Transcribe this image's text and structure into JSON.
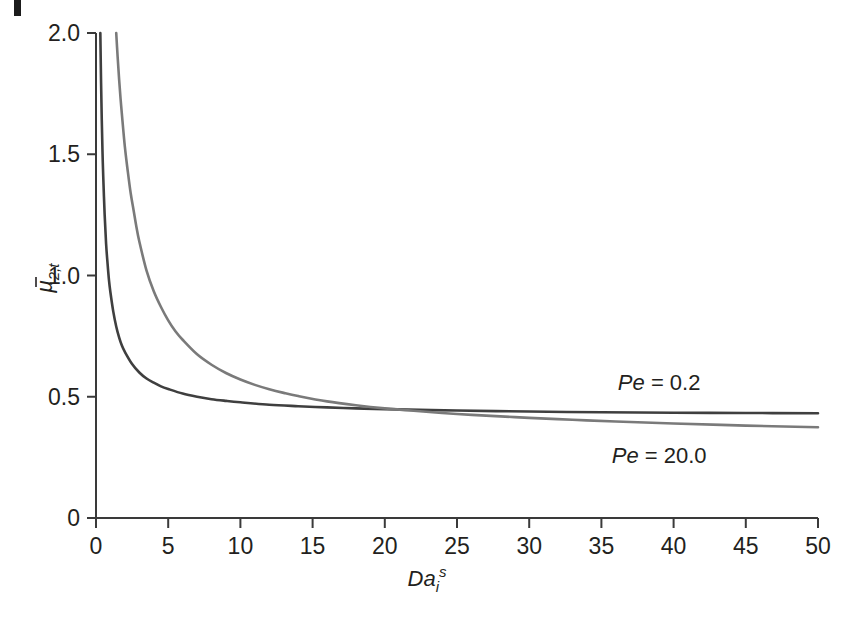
{
  "figure": {
    "background_color": "#ffffff",
    "axis_color": "#3a3a3a",
    "text_color": "#231f20",
    "edge_artifact": true
  },
  "chart_data": {
    "type": "line",
    "title": "",
    "subtitle": "",
    "xlabel_parts": {
      "base": "Da",
      "sub": "i",
      "sup": "s"
    },
    "xlabel": "Da_i^s",
    "ylabel_parts": {
      "base": "μ",
      "overbar": true,
      "sub": "2,t"
    },
    "ylabel": "μ̄2,t",
    "xlim": [
      0,
      50
    ],
    "ylim": [
      0,
      2.0
    ],
    "xticks": [
      0,
      5,
      10,
      15,
      20,
      25,
      30,
      35,
      40,
      45,
      50
    ],
    "xtick_labels": [
      "0",
      "5",
      "10",
      "15",
      "20",
      "25",
      "30",
      "35",
      "40",
      "45",
      "50"
    ],
    "yticks": [
      0,
      0.5,
      1.0,
      1.5,
      2.0
    ],
    "ytick_labels": [
      "0",
      "0.5",
      "1.0",
      "1.5",
      "2.0"
    ],
    "grid": false,
    "legend_position": "inline-annotations",
    "series": [
      {
        "name": "Pe = 0.2",
        "color": "#3f3f3f",
        "width": 2.6,
        "annotation": {
          "text_parts": {
            "italic": "Pe",
            "rest": " = 0.2"
          },
          "text": "Pe = 0.2",
          "x": 39.0,
          "y": 0.56
        },
        "x": [
          0.3,
          0.35,
          0.4,
          0.45,
          0.5,
          0.6,
          0.7,
          0.8,
          0.9,
          1.0,
          1.2,
          1.4,
          1.6,
          1.8,
          2.0,
          2.5,
          3.0,
          3.5,
          4.0,
          4.5,
          5.0,
          6.0,
          7.0,
          8.0,
          9.0,
          10.0,
          12.0,
          14.0,
          16.0,
          18.0,
          20.0,
          25.0,
          30.0,
          35.0,
          40.0,
          45.0,
          50.0
        ],
        "y": [
          2.0,
          1.8,
          1.64,
          1.51,
          1.41,
          1.25,
          1.13,
          1.05,
          0.98,
          0.93,
          0.85,
          0.79,
          0.745,
          0.71,
          0.685,
          0.635,
          0.6,
          0.575,
          0.558,
          0.543,
          0.532,
          0.513,
          0.5,
          0.49,
          0.483,
          0.477,
          0.467,
          0.461,
          0.456,
          0.452,
          0.449,
          0.443,
          0.439,
          0.436,
          0.434,
          0.433,
          0.432
        ]
      },
      {
        "name": "Pe = 20.0",
        "color": "#7a7a7a",
        "width": 2.6,
        "annotation": {
          "text_parts": {
            "italic": "Pe",
            "rest": " = 20.0"
          },
          "text": "Pe = 20.0",
          "x": 39.0,
          "y": 0.26
        },
        "x": [
          1.4,
          1.5,
          1.6,
          1.7,
          1.8,
          2.0,
          2.2,
          2.4,
          2.6,
          2.8,
          3.0,
          3.5,
          4.0,
          4.5,
          5.0,
          5.5,
          6.0,
          7.0,
          8.0,
          9.0,
          10.0,
          11.0,
          12.0,
          13.0,
          14.0,
          16.0,
          18.0,
          20.0,
          22.0,
          25.0,
          28.0,
          30.0,
          33.0,
          36.0,
          40.0,
          45.0,
          50.0
        ],
        "y": [
          2.0,
          1.9,
          1.81,
          1.73,
          1.66,
          1.53,
          1.43,
          1.34,
          1.27,
          1.2,
          1.14,
          1.02,
          0.935,
          0.87,
          0.815,
          0.77,
          0.735,
          0.675,
          0.632,
          0.598,
          0.571,
          0.549,
          0.531,
          0.516,
          0.503,
          0.481,
          0.465,
          0.452,
          0.442,
          0.429,
          0.419,
          0.413,
          0.405,
          0.398,
          0.39,
          0.381,
          0.374
        ]
      }
    ],
    "crossover": {
      "x": 12.5,
      "y": 0.465
    }
  }
}
